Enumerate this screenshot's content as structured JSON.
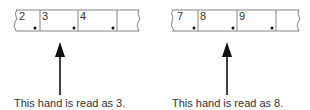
{
  "diagram": {
    "left": {
      "scale_numbers": [
        "2",
        "3",
        "4"
      ],
      "caption": "This hand is read as 3."
    },
    "right": {
      "scale_numbers": [
        "7",
        "8",
        "9"
      ],
      "caption": "This hand is read as 8."
    },
    "colors": {
      "line": "#555555",
      "arrow": "#111111",
      "dot": "#111111"
    }
  }
}
